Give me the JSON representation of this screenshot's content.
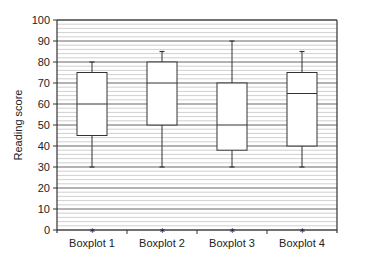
{
  "chart_data": {
    "type": "boxplot",
    "title": "",
    "xlabel": "",
    "ylabel": "Reading score",
    "ylim": [
      0,
      100
    ],
    "yticks": [
      0,
      10,
      20,
      30,
      40,
      50,
      60,
      70,
      80,
      90,
      100
    ],
    "minor_grid_step": 2,
    "grid": true,
    "legend": null,
    "categories": [
      "Boxplot 1",
      "Boxplot 2",
      "Boxplot 3",
      "Boxplot 4"
    ],
    "series": [
      {
        "name": "Boxplot 1",
        "min": 30,
        "q1": 45,
        "median": 60,
        "q3": 75,
        "max": 80,
        "outliers": [
          0
        ]
      },
      {
        "name": "Boxplot 2",
        "min": 30,
        "q1": 50,
        "median": 70,
        "q3": 80,
        "max": 85,
        "outliers": [
          0
        ]
      },
      {
        "name": "Boxplot 3",
        "min": 30,
        "q1": 38,
        "median": 50,
        "q3": 70,
        "max": 90,
        "outliers": [
          0
        ]
      },
      {
        "name": "Boxplot 4",
        "min": 30,
        "q1": 40,
        "median": 65,
        "q3": 75,
        "max": 85,
        "outliers": [
          0
        ]
      }
    ]
  },
  "colors": {
    "major_grid": "#555555",
    "minor_grid": "#c4c4c4",
    "box_stroke": "#333333",
    "box_fill": "#ffffff",
    "axis": "#333333"
  }
}
